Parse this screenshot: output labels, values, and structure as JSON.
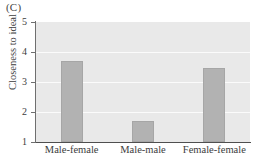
{
  "figure": {
    "panel_label": "(C)"
  },
  "chart_data": {
    "type": "bar",
    "title": "(C)",
    "xlabel": "",
    "ylabel": "Closeness to ideal",
    "categories": [
      "Male-female",
      "Male-male",
      "Female-female"
    ],
    "values": [
      3.7,
      1.7,
      3.45
    ],
    "ylim": [
      1,
      5
    ],
    "yticks": [
      1,
      2,
      3,
      4,
      5
    ],
    "ytick_labels": [
      "1",
      "2",
      "3",
      "4",
      "5"
    ],
    "grid": true,
    "grid_axis": "y",
    "legend": false,
    "colors": {
      "bar_fill": "#b2b2b2",
      "bar_edge": "#a6a6a6",
      "plot_background": "#e9e9e9",
      "gridline": "#fbfbfb",
      "axis": "#5c5c5c",
      "text": "#3c3c3c",
      "figure_background": "#ffffff"
    }
  }
}
